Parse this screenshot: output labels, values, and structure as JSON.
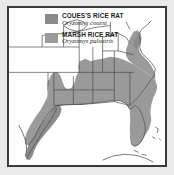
{
  "figure": {
    "kind": "range-map",
    "region": "Southeastern United States, Gulf Coast and eastern Mexico",
    "frame_color": "#3a3a3a",
    "background_color": "#e9e9e9",
    "map_background_color": "#ffffff"
  },
  "legend": {
    "entries": [
      {
        "common_name": "COUES'S RICE RAT",
        "scientific_name": "Oryzomys couesi",
        "swatch_color": "#8b8b8b"
      },
      {
        "common_name": "MARSH RICE RAT",
        "scientific_name": "Oryzomys palustris",
        "swatch_color": "#9b9b9b"
      }
    ]
  },
  "map": {
    "range_fill_color": "#9a9a9a",
    "range_fill_color_dark": "#8b8b8b",
    "border_line_color": "#4a4a4a",
    "coastline_color": "#555555"
  }
}
